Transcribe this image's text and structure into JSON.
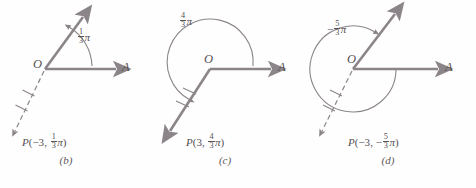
{
  "figure": {
    "stroke_color": "#8b8589",
    "text_color": "#555153",
    "background_color": "#fefefe",
    "panels": [
      {
        "id": "b",
        "caption": "(b)",
        "origin_label": "O",
        "axis_label": "A",
        "angle": {
          "numerator": "1",
          "denominator": "3",
          "symbol": "π",
          "sign": "",
          "text": "1/3 π",
          "direction": "counterclockwise"
        },
        "point": {
          "name": "P",
          "r": "−3",
          "theta_numerator": "1",
          "theta_denominator": "3",
          "theta_symbol": "π",
          "theta_sign": "",
          "text": "P(−3, 1/3 π)"
        },
        "terminal_ray": "solid-up-right",
        "point_ray": "dashed-down-left",
        "tick_marks": 2
      },
      {
        "id": "c",
        "caption": "(c)",
        "origin_label": "O",
        "axis_label": "A",
        "angle": {
          "numerator": "4",
          "denominator": "3",
          "symbol": "π",
          "sign": "",
          "text": "4/3 π",
          "direction": "counterclockwise"
        },
        "point": {
          "name": "P",
          "r": "3",
          "theta_numerator": "4",
          "theta_denominator": "3",
          "theta_symbol": "π",
          "theta_sign": "",
          "text": "P(3, 4/3 π)"
        },
        "terminal_ray": "solid-down-left",
        "point_ray": "solid-down-left",
        "tick_marks": 2
      },
      {
        "id": "d",
        "caption": "(d)",
        "origin_label": "O",
        "axis_label": "A",
        "angle": {
          "numerator": "5",
          "denominator": "3",
          "symbol": "π",
          "sign": "−",
          "text": "−5/3 π",
          "direction": "clockwise"
        },
        "point": {
          "name": "P",
          "r": "−3",
          "theta_numerator": "5",
          "theta_denominator": "3",
          "theta_symbol": "π",
          "theta_sign": "−",
          "text": "P(−3, −5/3 π)"
        },
        "terminal_ray": "solid-up-right",
        "point_ray": "dashed-down-left",
        "tick_marks": 2
      }
    ]
  }
}
